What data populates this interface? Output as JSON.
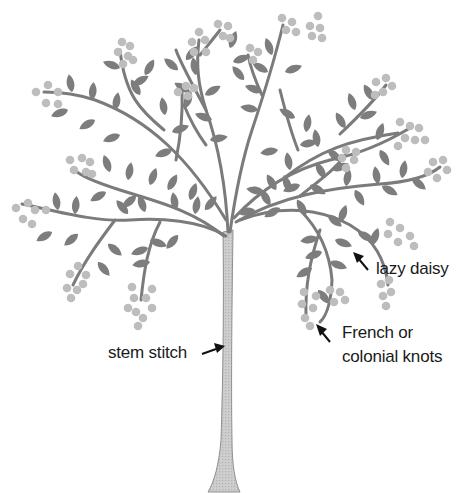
{
  "diagram": {
    "colors": {
      "background": "#ffffff",
      "branch": "#7b7b7b",
      "leaf": "#7d7d7d",
      "knot": "#bdbdbd",
      "trunk_fill": "#c9c9c9",
      "trunk_outline": "#8a8a8a",
      "text": "#1a1a1a",
      "arrow": "#111111"
    },
    "labels": [
      {
        "id": "lazy-daisy",
        "text": "lazy daisy",
        "points_to": "leaf"
      },
      {
        "id": "french-knots",
        "line1": "French or",
        "line2": "colonial knots",
        "points_to": "knot cluster"
      },
      {
        "id": "stem-stitch",
        "text": "stem stitch",
        "points_to": "trunk"
      }
    ]
  }
}
